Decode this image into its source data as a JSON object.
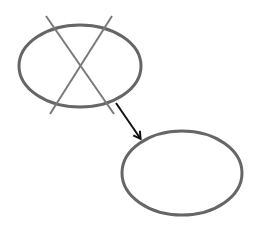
{
  "diagram": {
    "colors": {
      "background": "#ffffff",
      "ellipse_stroke": "#666666",
      "cross_stroke": "#7a7a7a",
      "arrow_stroke": "#111111"
    },
    "nodes": [
      {
        "id": "old-ellipse",
        "cx": 80,
        "cy": 66,
        "rx": 61,
        "ry": 41,
        "crossed_out": true
      },
      {
        "id": "new-ellipse",
        "cx": 182,
        "cy": 173,
        "rx": 60,
        "ry": 42,
        "crossed_out": false
      }
    ],
    "cross_lines": [
      {
        "x1": 46,
        "y1": 16,
        "x2": 114,
        "y2": 114
      },
      {
        "x1": 112,
        "y1": 16,
        "x2": 50,
        "y2": 114
      }
    ],
    "arrow": {
      "from": "old-ellipse",
      "to": "new-ellipse",
      "x1": 116,
      "y1": 103,
      "x2": 140,
      "y2": 138
    }
  }
}
